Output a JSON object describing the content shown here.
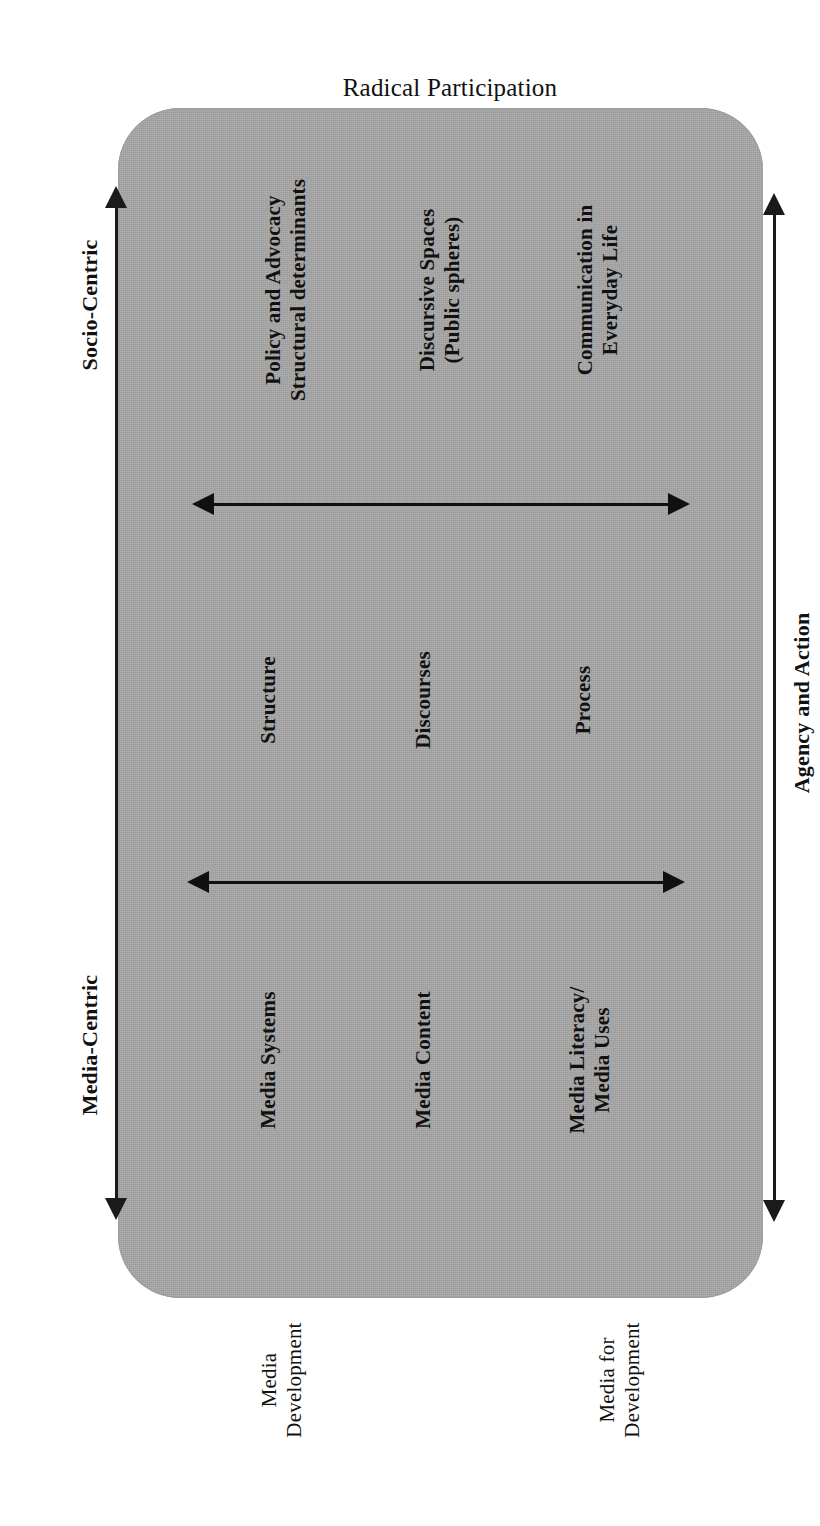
{
  "figure": {
    "title": "Radical Participation",
    "axes": {
      "socio_centric": "Socio-Centric",
      "media_centric": "Media-Centric",
      "agency_and_action": "Agency and Action"
    },
    "outer_labels": [
      {
        "line1": "Media",
        "line2": "Development"
      },
      {
        "line1": "Media for",
        "line2": "Development"
      }
    ],
    "columns": {
      "media_centric_row": [
        {
          "line1": "Media Systems",
          "line2": ""
        },
        {
          "line1": "Media Content",
          "line2": ""
        },
        {
          "line1": "Media Literacy/",
          "line2": "Media Uses"
        }
      ],
      "middle_row": [
        {
          "line1": "Structure",
          "line2": ""
        },
        {
          "line1": "Discourses",
          "line2": ""
        },
        {
          "line1": "Process",
          "line2": ""
        }
      ],
      "socio_centric_row": [
        {
          "line1": "Policy and Advocacy",
          "line2": "Structural determinants"
        },
        {
          "line1": "Discursive Spaces",
          "line2": "(Public spheres)"
        },
        {
          "line1": "Communication in",
          "line2": "Everyday Life"
        }
      ]
    },
    "colors": {
      "panel_fill": "#a8a8a8",
      "arrow": "#1a1a1a",
      "text": "#111111",
      "background": "#ffffff"
    }
  }
}
